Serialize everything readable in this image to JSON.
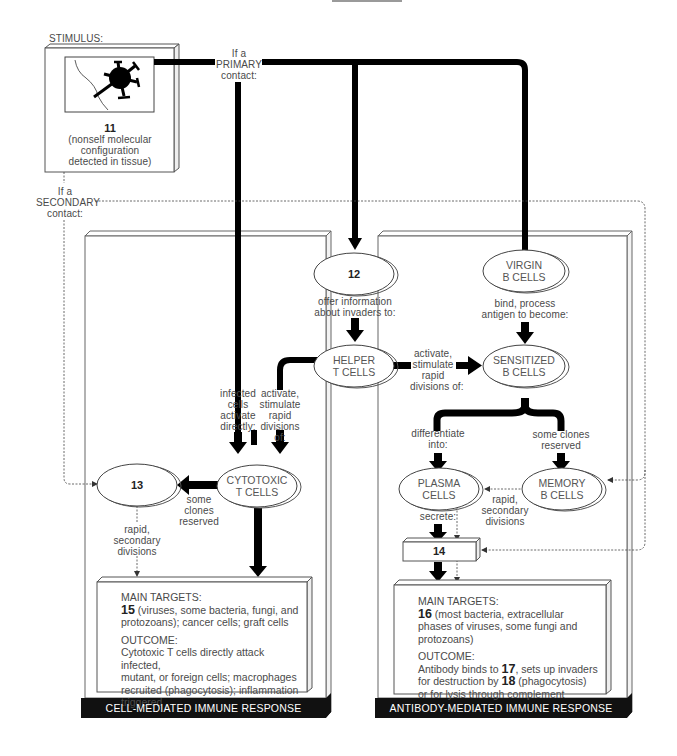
{
  "stimulus": {
    "heading": "STIMULUS:",
    "number": "11",
    "caption_lines": [
      "(nonself molecular",
      "configuration",
      "detected in tissue)"
    ]
  },
  "primary_contact": {
    "lines": [
      "If a",
      "PRIMARY",
      "contact:"
    ]
  },
  "secondary_contact": {
    "lines": [
      "If a",
      "SECONDARY",
      "contact:"
    ]
  },
  "nodes": {
    "n12": {
      "number": "12"
    },
    "virgin_b": {
      "lines": [
        "VIRGIN",
        "B CELLS"
      ]
    },
    "helper_t": {
      "lines": [
        "HELPER",
        "T CELLS"
      ]
    },
    "sensitized_b": {
      "lines": [
        "SENSITIZED",
        "B CELLS"
      ]
    },
    "cytotoxic_t": {
      "lines": [
        "CYTOTOXIC",
        "T CELLS"
      ]
    },
    "n13": {
      "number": "13"
    },
    "plasma": {
      "lines": [
        "PLASMA",
        "CELLS"
      ]
    },
    "memory_b": {
      "lines": [
        "MEMORY",
        "B CELLS"
      ]
    },
    "n14": {
      "number": "14"
    }
  },
  "edge_labels": {
    "offer_info": [
      "offer information",
      "about invaders to:"
    ],
    "bind_process": [
      "bind, process",
      "antigen to become:"
    ],
    "activate_helper_to_b": [
      "activate,",
      "stimulate",
      "rapid",
      "divisions of:"
    ],
    "infected_cells": [
      "infected",
      "cells",
      "activate",
      "directly:"
    ],
    "activate_helper_to_t": [
      "activate,",
      "stimulate",
      "rapid",
      "divisions",
      "of:"
    ],
    "t_clones_reserved": [
      "some",
      "clones",
      "reserved"
    ],
    "t_rapid_secondary": [
      "rapid,",
      "secondary",
      "divisions"
    ],
    "differentiate": [
      "differentiate",
      "into:"
    ],
    "b_clones_reserved": [
      "some clones",
      "reserved"
    ],
    "b_rapid_secondary": [
      "rapid,",
      "secondary",
      "divisions"
    ],
    "secrete": [
      "secrete:"
    ]
  },
  "cell_mediated": {
    "main_targets_heading": "MAIN TARGETS:",
    "main_targets_number": "15",
    "main_targets_lines": [
      " (viruses, some bacteria, fungi, and",
      "protozoans); cancer cells; graft cells"
    ],
    "outcome_heading": "OUTCOME:",
    "outcome_lines": [
      "Cytotoxic T cells directly attack infected,",
      "mutant, or foreign cells; macrophages",
      "recruited (phagocytosis); inflammation",
      "triggered"
    ],
    "banner": "CELL-MEDIATED IMMUNE RESPONSE"
  },
  "antibody_mediated": {
    "main_targets_heading": "MAIN TARGETS:",
    "main_targets_number": "16",
    "main_targets_lines": [
      " (most bacteria, extracellular",
      "phases of viruses, some fungi and",
      "protozoans)"
    ],
    "outcome_heading": "OUTCOME:",
    "outcome_line1_pre": "Antibody binds to ",
    "outcome_number_17": "17",
    "outcome_line1_post": ", sets up invaders",
    "outcome_line2_pre": "for destruction by ",
    "outcome_number_18": "18",
    "outcome_line2_post": " (phagocytosis)",
    "outcome_line3": "or for lysis through complement",
    "banner": "ANTIBODY-MEDIATED IMMUNE RESPONSE"
  },
  "colors": {
    "ink": "#000000",
    "text": "#4a4a4a",
    "box_edge": "#555555",
    "banner": "#111111"
  }
}
